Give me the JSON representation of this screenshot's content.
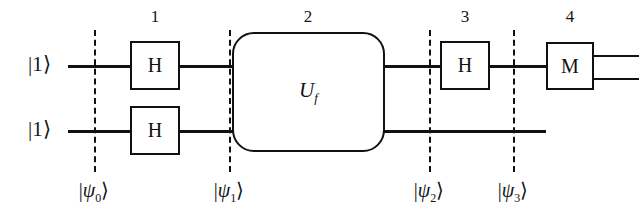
{
  "figure": {
    "type": "quantum-circuit-diagram",
    "line_color": "#111111",
    "background": "#ffffff"
  },
  "step_numbers": [
    {
      "label": "1",
      "x": 155
    },
    {
      "label": "2",
      "x": 308
    },
    {
      "label": "3",
      "x": 465
    },
    {
      "label": "4",
      "x": 570
    }
  ],
  "inputs": [
    {
      "label": "|1⟩",
      "wire": "top"
    },
    {
      "label": "|1⟩",
      "wire": "bottom"
    }
  ],
  "gates": [
    {
      "name": "hadamard-top",
      "label": "H",
      "step": 1,
      "wire": "top"
    },
    {
      "name": "hadamard-bottom",
      "label": "H",
      "step": 1,
      "wire": "bottom"
    },
    {
      "name": "oracle",
      "label": "U",
      "sub": "f",
      "step": 2,
      "wire": "both"
    },
    {
      "name": "hadamard-top-2",
      "label": "H",
      "step": 3,
      "wire": "top"
    },
    {
      "name": "measurement",
      "label": "M",
      "step": 4,
      "wire": "top"
    }
  ],
  "state_labels": [
    {
      "psi": "ψ",
      "sub": "0",
      "x": 94
    },
    {
      "psi": "ψ",
      "sub": "1",
      "x": 229
    },
    {
      "psi": "ψ",
      "sub": "2",
      "x": 429
    },
    {
      "psi": "ψ",
      "sub": "3",
      "x": 513
    }
  ]
}
